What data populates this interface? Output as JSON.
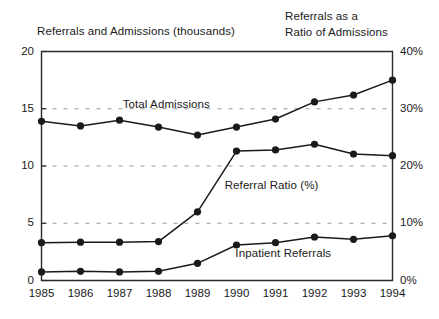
{
  "figure": {
    "title_left": "Referrals and Admissions (thousands)",
    "title_right_line1": "Referrals as a",
    "title_right_line2": "Ratio of Admissions"
  },
  "chart_data": {
    "type": "line",
    "title": "",
    "xlabel": "",
    "ylabel": "Referrals and Admissions (thousands)",
    "ylabel_right": "Referrals as a Ratio of Admissions",
    "grid": true,
    "legend_position": "inline-annotations",
    "x": [
      "1985",
      "1986",
      "1987",
      "1988",
      "1989",
      "1990",
      "1991",
      "1992",
      "1993",
      "1994"
    ],
    "categories": [
      "1985",
      "1986",
      "1987",
      "1988",
      "1989",
      "1990",
      "1991",
      "1992",
      "1993",
      "1994"
    ],
    "ylim": [
      0,
      20
    ],
    "yticks": [
      "0",
      "5",
      "10",
      "15",
      "20"
    ],
    "ytick_values": [
      0,
      5,
      10,
      15,
      20
    ],
    "ylim_right": [
      0,
      40
    ],
    "yticks_right": [
      "0%",
      "10%",
      "20%",
      "30%",
      "40%"
    ],
    "ytick_values_right": [
      0,
      10,
      20,
      30,
      40
    ],
    "series": [
      {
        "name": "Total Admissions",
        "axis": "left",
        "marker": "filled-circle",
        "values": [
          13.9,
          13.5,
          14.0,
          13.4,
          12.7,
          13.4,
          14.1,
          15.6,
          16.2,
          17.5
        ]
      },
      {
        "name": "Referral Ratio (%)",
        "axis": "right",
        "marker": "filled-circle",
        "values": [
          6.6,
          6.7,
          6.7,
          6.8,
          12.0,
          22.6,
          22.8,
          23.8,
          22.1,
          21.8
        ],
        "values_left_scale": [
          3.3,
          3.35,
          3.35,
          3.4,
          6.0,
          11.3,
          11.4,
          11.9,
          11.05,
          10.9
        ]
      },
      {
        "name": "Inpatient Referrals",
        "axis": "left",
        "marker": "filled-circle",
        "values": [
          0.75,
          0.8,
          0.75,
          0.8,
          1.5,
          3.1,
          3.3,
          3.8,
          3.6,
          3.9
        ]
      }
    ],
    "annotations": [
      {
        "text": "Total Admissions",
        "x": "1988.2",
        "y": "15.2"
      },
      {
        "text": "Referral Ratio (%)",
        "x": "1990.9",
        "y": "8.2"
      },
      {
        "text": "Inpatient Referrals",
        "x": "1991.2",
        "y": "2.2"
      }
    ]
  }
}
